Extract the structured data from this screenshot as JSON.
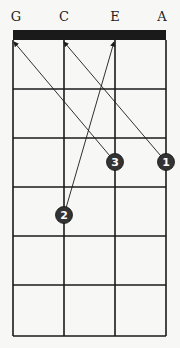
{
  "diagram": {
    "type": "ukulele-chord-chart",
    "strings": [
      {
        "label": "G",
        "x": 13
      },
      {
        "label": "C",
        "x": 64
      },
      {
        "label": "E",
        "x": 115
      },
      {
        "label": "A",
        "x": 166
      }
    ],
    "nut": {
      "top": 30,
      "bottom": 40
    },
    "frets_y": [
      40,
      89,
      138,
      187,
      236,
      285,
      336
    ],
    "fingers": [
      {
        "number": "1",
        "string": "A",
        "cx": 166,
        "cy": 162,
        "arrow_to": {
          "x": 64,
          "y": 40
        }
      },
      {
        "number": "2",
        "string": "C",
        "cx": 64,
        "cy": 215,
        "arrow_to": {
          "x": 114,
          "y": 40
        }
      },
      {
        "number": "3",
        "string": "E",
        "cx": 115,
        "cy": 162,
        "arrow_to": {
          "x": 14,
          "y": 40
        }
      }
    ],
    "colors": {
      "line": "#1a1a1a",
      "finger_fill": "#333333",
      "finger_text": "#ffffff",
      "background": "#f7f7f5"
    }
  }
}
